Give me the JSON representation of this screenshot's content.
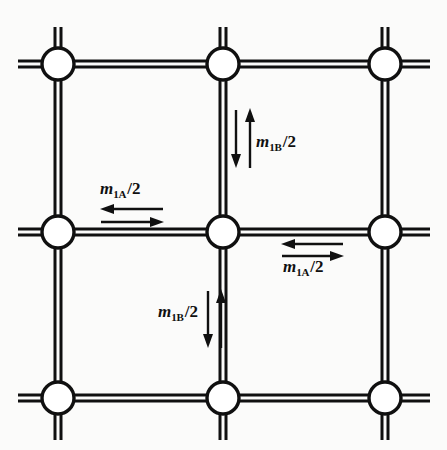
{
  "figure": {
    "background_color": "#fbfbfa",
    "line_color": "#101010",
    "node_fill_color": "#ffffff",
    "width": 447,
    "height": 450
  },
  "lattice": {
    "rows": 3,
    "cols": 3,
    "x_positions": [
      58,
      223,
      385
    ],
    "y_positions": [
      64,
      232,
      398
    ],
    "node_radius": 17,
    "bond_style": "double-line",
    "bond_outer_width": 3,
    "bond_inner_gap": 4,
    "stub_extent": {
      "left": 18,
      "right": 430,
      "top": 27,
      "bottom": 440
    },
    "nodes": [
      {
        "id": "n-top-left",
        "row": 0,
        "col": 0,
        "cx": 58,
        "cy": 64
      },
      {
        "id": "n-top-center",
        "row": 0,
        "col": 1,
        "cx": 223,
        "cy": 64
      },
      {
        "id": "n-top-right",
        "row": 0,
        "col": 2,
        "cx": 385,
        "cy": 64
      },
      {
        "id": "n-mid-left",
        "row": 1,
        "col": 0,
        "cx": 58,
        "cy": 232
      },
      {
        "id": "n-mid-center",
        "row": 1,
        "col": 1,
        "cx": 223,
        "cy": 232
      },
      {
        "id": "n-mid-right",
        "row": 1,
        "col": 2,
        "cx": 385,
        "cy": 232
      },
      {
        "id": "n-bottom-left",
        "row": 2,
        "col": 0,
        "cx": 58,
        "cy": 398
      },
      {
        "id": "n-bottom-center",
        "row": 2,
        "col": 1,
        "cx": 223,
        "cy": 398
      },
      {
        "id": "n-bottom-right",
        "row": 2,
        "col": 2,
        "cx": 385,
        "cy": 398
      }
    ]
  },
  "annotations": [
    {
      "id": "m1b-top",
      "symbol": "m",
      "subscript": "1B",
      "suffix": "/2",
      "text": "m1B/2",
      "orientation": "vertical",
      "position": "upper-center",
      "arrows": [
        {
          "name": "down-arrow",
          "direction": "down",
          "x": 236,
          "y1": 110,
          "y2": 165
        },
        {
          "name": "up-arrow",
          "direction": "up",
          "x": 250,
          "y1": 165,
          "y2": 110
        }
      ],
      "label_x": 256,
      "label_y": 133
    },
    {
      "id": "m1a-left",
      "symbol": "m",
      "subscript": "1A",
      "suffix": "/2",
      "text": "m1A/2",
      "orientation": "horizontal",
      "position": "mid-left",
      "arrows": [
        {
          "name": "left-arrow",
          "direction": "left",
          "y": 209,
          "x1": 163,
          "x2": 101
        },
        {
          "name": "right-arrow",
          "direction": "right",
          "y": 222,
          "x1": 101,
          "x2": 163
        }
      ],
      "label_x": 100,
      "label_y": 180
    },
    {
      "id": "m1a-right",
      "symbol": "m",
      "subscript": "1A",
      "suffix": "/2",
      "text": "m1A/2",
      "orientation": "horizontal",
      "position": "mid-right",
      "arrows": [
        {
          "name": "left-arrow",
          "direction": "left",
          "y": 244,
          "x1": 343,
          "x2": 282
        },
        {
          "name": "right-arrow",
          "direction": "right",
          "y": 256,
          "x1": 282,
          "x2": 343
        }
      ],
      "label_x": 283,
      "label_y": 258
    },
    {
      "id": "m1b-bot",
      "symbol": "m",
      "subscript": "1B",
      "suffix": "/2",
      "text": "m1B/2",
      "orientation": "vertical",
      "position": "lower-center",
      "arrows": [
        {
          "name": "down-arrow",
          "direction": "down",
          "x": 208,
          "y1": 291,
          "y2": 345
        },
        {
          "name": "up-arrow",
          "direction": "up",
          "x": 221,
          "y1": 345,
          "y2": 291
        }
      ],
      "label_x": 158,
      "label_y": 303
    }
  ]
}
